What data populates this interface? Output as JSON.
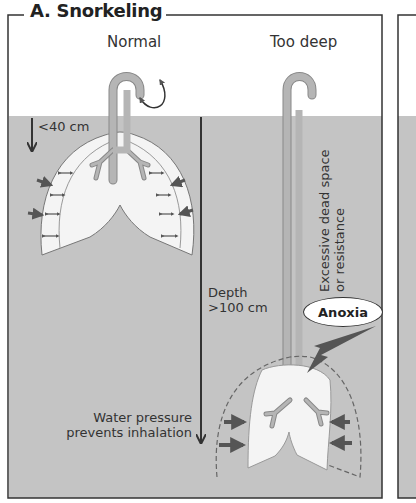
{
  "panel": {
    "title": "A. Snorkeling",
    "colors": {
      "water": "#c4c4c4",
      "lung": "#f0f0f0",
      "tube": "#b5b5b5",
      "arrow": "#555555",
      "line": "#333333"
    }
  },
  "normal": {
    "heading": "Normal",
    "depth_label": "<40 cm"
  },
  "too_deep": {
    "heading": "Too deep",
    "depth_label_line1": "Depth",
    "depth_label_line2": ">100 cm",
    "dead_space_line1": "Excessive dead space",
    "dead_space_line2": "or resistance",
    "anoxia": "Anoxia",
    "pressure_line1": "Water pressure",
    "pressure_line2": "prevents inhalation"
  }
}
